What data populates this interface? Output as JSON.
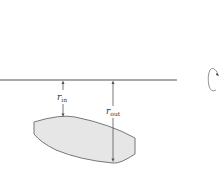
{
  "diagram": {
    "type": "radius-of-revolution",
    "axis": {
      "label": "axis of rotation"
    },
    "labels": {
      "r_in_main": "r",
      "r_in_sub": "in",
      "r_out_main": "r",
      "r_out_sub": "out"
    },
    "region": {
      "fill": "#e6e6e6",
      "stroke": "#777777"
    },
    "rotation_icon": "rotation-arrow-icon",
    "colors": {
      "line": "#555555",
      "region_fill": "#e6e6e6"
    }
  }
}
